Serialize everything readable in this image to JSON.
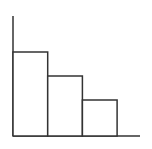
{
  "chart_data": {
    "type": "bar",
    "title": "",
    "xlabel": "",
    "ylabel": "",
    "categories": [
      "",
      "",
      ""
    ],
    "values": [
      7,
      5,
      3
    ],
    "ylim": [
      0,
      10
    ],
    "grid": false,
    "legend": null,
    "colors": {
      "stroke": "#333333",
      "fill": "#ffffff",
      "background": "#ffffff"
    }
  }
}
